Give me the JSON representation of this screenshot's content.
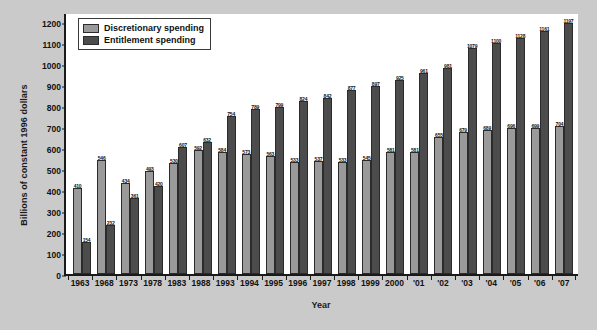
{
  "chart_data": {
    "type": "bar",
    "title": "",
    "xlabel": "Year",
    "ylabel": "Billions of constant 1996 dollars",
    "ylim": [
      0,
      1250
    ],
    "yticks": [
      0,
      100,
      200,
      300,
      400,
      500,
      600,
      700,
      800,
      900,
      1000,
      1100,
      1200
    ],
    "grid": false,
    "legend_position": "top-left",
    "categories": [
      "1963",
      "1968",
      "1973",
      "1978",
      "1983",
      "1988",
      "1993",
      "1994",
      "1995",
      "1996",
      "1997",
      "1998",
      "1999",
      "2000",
      "'01",
      "'02",
      "'03",
      "'04",
      "'05",
      "'06",
      "'07"
    ],
    "series": [
      {
        "name": "Discretionary spending",
        "color": "#9a9a9a",
        "values": [
          410,
          546,
          434,
          493,
          530,
          592,
          584,
          573,
          563,
          533,
          537,
          533,
          545,
          581,
          581,
          655,
          679,
          689,
          696,
          699,
          704
        ]
      },
      {
        "name": "Entitlement spending",
        "color": "#4c4c4c",
        "values": [
          154,
          232,
          361,
          420,
          607,
          632,
          754,
          789,
          799,
          824,
          842,
          877,
          897,
          925,
          961,
          981,
          1079,
          1100,
          1128,
          1161,
          1197
        ]
      }
    ]
  },
  "legend": {
    "items": [
      {
        "label": "Discretionary spending",
        "swatch": "disc"
      },
      {
        "label": "Entitlement spending",
        "swatch": "ent"
      }
    ]
  }
}
